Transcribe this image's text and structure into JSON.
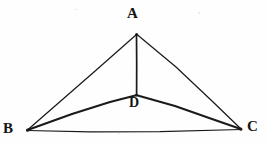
{
  "figure": {
    "kind": "geometry-diagram",
    "background_color": "#fefefe",
    "stroke_color": "#1a1a1a",
    "labels": {
      "apex": "A",
      "bottom_left": "B",
      "bottom_right": "C",
      "interior": "D"
    },
    "points": {
      "A": {
        "x": 136,
        "y": 34
      },
      "B": {
        "x": 27,
        "y": 130
      },
      "C": {
        "x": 241,
        "y": 129
      },
      "D": {
        "x": 136,
        "y": 95
      }
    },
    "segments": [
      {
        "name": "AB",
        "from": "A",
        "to": "B",
        "width": 1.2
      },
      {
        "name": "AC",
        "from": "A",
        "to": "C",
        "width": 1.2
      },
      {
        "name": "BC",
        "from": "B",
        "to": "C",
        "width": 1.2
      },
      {
        "name": "AD",
        "from": "A",
        "to": "D",
        "width": 1.6
      },
      {
        "name": "BD",
        "from": "B",
        "to": "D",
        "width": 2.0
      },
      {
        "name": "DC",
        "from": "D",
        "to": "C",
        "width": 2.0
      }
    ]
  }
}
